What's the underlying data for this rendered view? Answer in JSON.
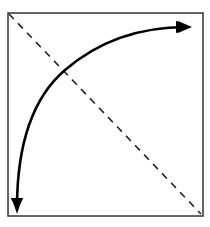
{
  "diagram": {
    "elements": [
      {
        "name": "frame",
        "shape": "square",
        "style": "solid"
      },
      {
        "name": "diagonal",
        "shape": "line",
        "style": "dashed",
        "from": "top-left",
        "to": "bottom-right"
      },
      {
        "name": "arc-arrow",
        "shape": "curve",
        "style": "solid",
        "heads": [
          "start",
          "end"
        ],
        "from": "bottom-left",
        "to": "top-right"
      }
    ],
    "colors": {
      "stroke": "#000000",
      "frame": "#333333",
      "dash": "#222222",
      "background": "#ffffff"
    }
  }
}
